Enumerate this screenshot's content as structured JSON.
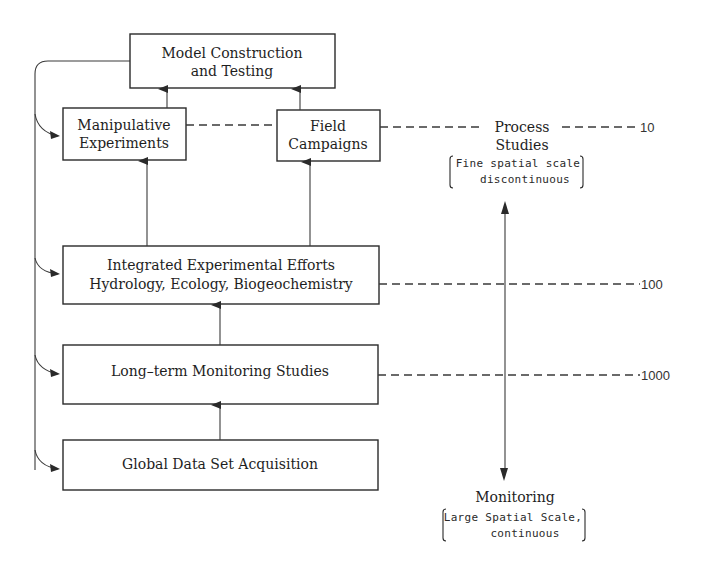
{
  "boxes": {
    "model": {
      "line1": "Model Construction",
      "line2": "and Testing"
    },
    "manipulative": {
      "line1": "Manipulative",
      "line2": "Experiments"
    },
    "field": {
      "line1": "Field",
      "line2": "Campaigns"
    },
    "integrated": {
      "line1": "Integrated Experimental Efforts",
      "line2": "Hydrology, Ecology, Biogeochemistry"
    },
    "longterm": {
      "line1": "Long–term Monitoring Studies"
    },
    "global": {
      "line1": "Global Data Set Acquisition"
    }
  },
  "scale": {
    "top": {
      "title_line1": "Process",
      "title_line2": "Studies",
      "detail_line1": "Fine spatial scale",
      "detail_line2": "discontinuous"
    },
    "bottom": {
      "title": "Monitoring",
      "detail_line1": "Large Spatial Scale,",
      "detail_line2": "continuous"
    },
    "ticks": [
      "10",
      "100",
      "1000"
    ]
  },
  "colors": {
    "stroke": "#2a2a2a",
    "text": "#1e1e1e",
    "background": "#ffffff"
  }
}
